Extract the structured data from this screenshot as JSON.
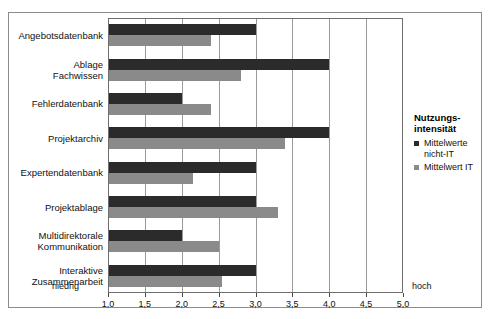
{
  "chart_data": {
    "type": "bar",
    "orientation": "horizontal",
    "title": "",
    "xlabel": "",
    "ylabel": "",
    "xlim": [
      1.0,
      5.0
    ],
    "xticks": [
      "1,0",
      "1,5",
      "2,0",
      "2,5",
      "3,0",
      "3,5",
      "4,0",
      "4,5",
      "5,0"
    ],
    "xtick_values": [
      1.0,
      1.5,
      2.0,
      2.5,
      3.0,
      3.5,
      4.0,
      4.5,
      5.0
    ],
    "axis_low_label": "niedrig",
    "axis_high_label": "hoch",
    "grid": true,
    "legend_position": "right",
    "categories": [
      "Angebotsdatenbank",
      "Ablage Fachwissen",
      "Fehlerdatenbank",
      "Projektarchiv",
      "Expertendatenbank",
      "Projektablage",
      "Multidirektorale Kommunikation",
      "Interaktive Zusammenarbeit"
    ],
    "category_lines": [
      [
        "Angebotsdatenbank"
      ],
      [
        "Ablage",
        "Fachwissen"
      ],
      [
        "Fehlerdatenbank"
      ],
      [
        "Projektarchiv"
      ],
      [
        "Expertendatenbank"
      ],
      [
        "Projektablage"
      ],
      [
        "Multidirektorale",
        "Kommunikation"
      ],
      [
        "Interaktive",
        "Zusammenarbeit"
      ]
    ],
    "series": [
      {
        "name": "Mittelwerte nicht-IT",
        "color": "#2b2b2b",
        "values": [
          3.0,
          4.0,
          2.0,
          4.0,
          3.0,
          3.0,
          2.0,
          3.0
        ]
      },
      {
        "name": "Mittelwert IT",
        "color": "#8a8a8a",
        "values": [
          2.4,
          2.8,
          2.4,
          3.4,
          2.15,
          3.3,
          2.5,
          2.55
        ]
      }
    ]
  },
  "legend": {
    "title_line1": "Nutzungs-",
    "title_line2": "intensität",
    "items": [
      {
        "label_line1": "Mittelwerte",
        "label_line2": "nicht-IT",
        "color": "#2b2b2b"
      },
      {
        "label_line1": "Mittelwert IT",
        "label_line2": "",
        "color": "#8a8a8a"
      }
    ]
  },
  "title_fragment": "",
  "colors": {
    "series_dark": "#2b2b2b",
    "series_gray": "#8a8a8a",
    "grid": "#9a9a9a",
    "frame": "#6e6e6e",
    "outer_frame": "#8b8b8b",
    "background": "#ffffff"
  }
}
